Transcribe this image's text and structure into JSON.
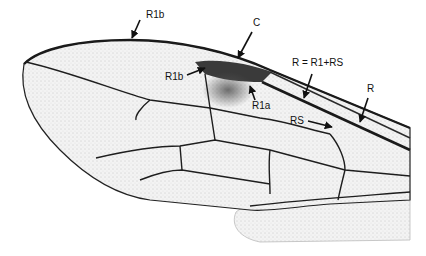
{
  "figure": {
    "labels": [
      {
        "id": "r1b-top",
        "text": "R1b",
        "x": 146,
        "y": 15
      },
      {
        "id": "c",
        "text": "C",
        "x": 253,
        "y": 18
      },
      {
        "id": "r1b-inner",
        "text": "R1b",
        "x": 165,
        "y": 74
      },
      {
        "id": "r1a",
        "text": "R1a",
        "x": 252,
        "y": 103
      },
      {
        "id": "r-eq",
        "text": "R = R1+RS",
        "x": 292,
        "y": 59
      },
      {
        "id": "r",
        "text": "R",
        "x": 367,
        "y": 84
      },
      {
        "id": "rs",
        "text": "RS",
        "x": 290,
        "y": 117
      }
    ],
    "colors": {
      "membrane": "#f1f1f1",
      "vein": "#1e1e1e",
      "pterostigma": "#3a3a3a",
      "text": "#111111"
    }
  }
}
